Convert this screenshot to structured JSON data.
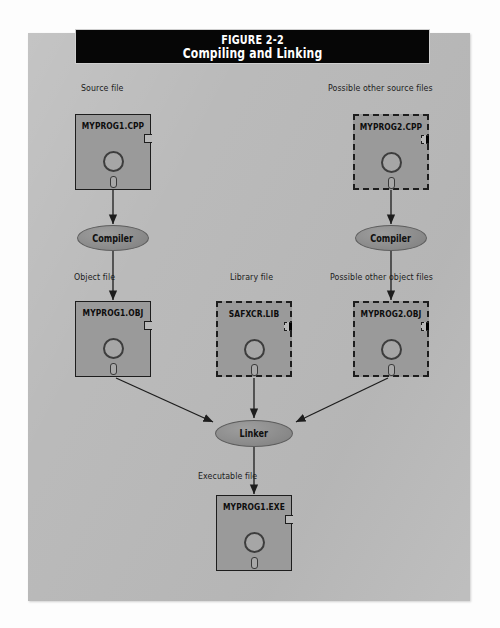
{
  "figure": {
    "number": "FIGURE 2-2",
    "caption": "Compiling and Linking",
    "title_bar_color": "#060606",
    "panel_color": "#b9b9b9",
    "disk_color": "#9a9a9a",
    "ink_color": "#1d1d1d"
  },
  "captions": {
    "source_file": "Source file",
    "possible_other_source_files": "Possible other source files",
    "object_file": "Object file",
    "library_file": "Library file",
    "possible_other_object_files": "Possible other object files",
    "executable_file": "Executable file"
  },
  "disks": [
    {
      "id": "myprog1-cpp",
      "name": "MYPROG1.CPP",
      "style": "solid",
      "kind": "source file"
    },
    {
      "id": "myprog2-cpp",
      "name": "MYPROG2.CPP",
      "style": "dashed",
      "kind": "source file"
    },
    {
      "id": "myprog1-obj",
      "name": "MYPROG1.OBJ",
      "style": "solid",
      "kind": "object file"
    },
    {
      "id": "safxcr-lib",
      "name": "SAFXCR.LIB",
      "style": "dashed",
      "kind": "library file"
    },
    {
      "id": "myprog2-obj",
      "name": "MYPROG2.OBJ",
      "style": "dashed",
      "kind": "object file"
    },
    {
      "id": "myprog1-exe",
      "name": "MYPROG1.EXE",
      "style": "solid",
      "kind": "executable file"
    }
  ],
  "processes": [
    {
      "id": "compiler-left",
      "label": "Compiler"
    },
    {
      "id": "compiler-right",
      "label": "Compiler"
    },
    {
      "id": "linker",
      "label": "Linker"
    }
  ],
  "flow": [
    {
      "from": "MYPROG1.CPP",
      "to": "Compiler",
      "label": ""
    },
    {
      "from": "MYPROG2.CPP",
      "to": "Compiler",
      "label": ""
    },
    {
      "from": "Compiler",
      "to": "MYPROG1.OBJ",
      "label": "Object file"
    },
    {
      "from": "Compiler",
      "to": "MYPROG2.OBJ",
      "label": "Possible other object files"
    },
    {
      "from": "MYPROG1.OBJ",
      "to": "Linker",
      "label": ""
    },
    {
      "from": "SAFXCR.LIB",
      "to": "Linker",
      "label": ""
    },
    {
      "from": "MYPROG2.OBJ",
      "to": "Linker",
      "label": ""
    },
    {
      "from": "Linker",
      "to": "MYPROG1.EXE",
      "label": "Executable file"
    }
  ]
}
